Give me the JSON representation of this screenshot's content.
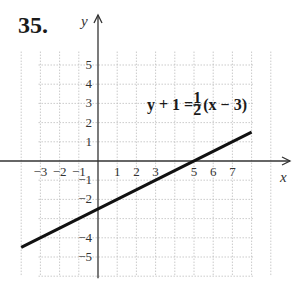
{
  "problem_number": "35.",
  "chart_data": {
    "type": "line",
    "title": "",
    "xlabel": "x",
    "ylabel": "y",
    "xlim": [
      -4,
      9
    ],
    "ylim": [
      -6,
      6
    ],
    "grid": true,
    "x_tick_labels": [
      {
        "value": -3,
        "label": "−3"
      },
      {
        "value": -2,
        "label": "−2"
      },
      {
        "value": -1,
        "label": "−1"
      },
      {
        "value": 1,
        "label": "1"
      },
      {
        "value": 2,
        "label": "2"
      },
      {
        "value": 3,
        "label": "3"
      },
      {
        "value": 5,
        "label": "5"
      },
      {
        "value": 6,
        "label": "6"
      },
      {
        "value": 7,
        "label": "7"
      }
    ],
    "y_tick_labels": [
      {
        "value": 5,
        "label": "5"
      },
      {
        "value": 4,
        "label": "4"
      },
      {
        "value": 3,
        "label": "3"
      },
      {
        "value": 2,
        "label": "2"
      },
      {
        "value": 1,
        "label": "1"
      },
      {
        "value": -1,
        "label": "−1"
      },
      {
        "value": -2,
        "label": "−2"
      },
      {
        "value": -4,
        "label": "−4"
      },
      {
        "value": -5,
        "label": "−5"
      }
    ],
    "series": [
      {
        "name": "y + 1 = 1/2(x − 3)",
        "equation_text": {
          "lhs": "y + 1 = ",
          "num": "1",
          "den": "2",
          "rhs": "(x − 3)"
        },
        "slope": 0.5,
        "intercept": -2.5,
        "x": [
          -4,
          8
        ],
        "y": [
          -4.5,
          1.5
        ],
        "color": "#111111"
      }
    ]
  }
}
